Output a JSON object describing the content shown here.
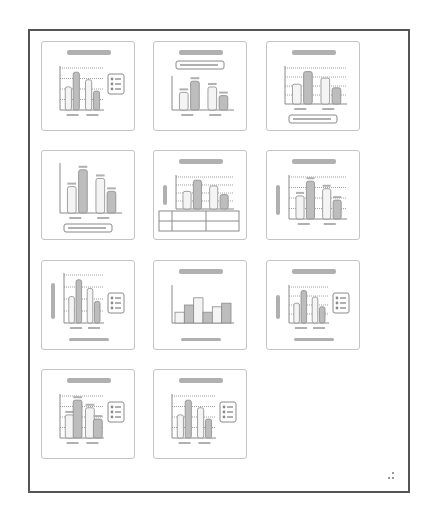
{
  "gallery": {
    "name": "Chart Quick Layout gallery",
    "columns": 3,
    "layouts": [
      {
        "id": "layout-1",
        "title": true,
        "legend": "right",
        "gridlines": true,
        "ytitle": false,
        "xtitle": false,
        "table": false
      },
      {
        "id": "layout-2",
        "title": true,
        "legend": "top",
        "gridlines": false,
        "datalabels": true
      },
      {
        "id": "layout-3",
        "title": true,
        "legend": "bottom",
        "gridlines": true
      },
      {
        "id": "layout-4",
        "title": false,
        "legend": "bottom",
        "gridlines": false,
        "datalabels": true
      },
      {
        "id": "layout-5",
        "title": true,
        "legend": "none",
        "gridlines": true,
        "ytitle": true,
        "table": true
      },
      {
        "id": "layout-6",
        "title": true,
        "legend": "none",
        "gridlines": true,
        "ytitle": true,
        "datalabels": true
      },
      {
        "id": "layout-7",
        "title": false,
        "legend": "right",
        "gridlines": true,
        "ytitle": true,
        "xtitle": true
      },
      {
        "id": "layout-8",
        "title": true,
        "legend": "none",
        "gridlines": false,
        "xtitle": true,
        "gapless": true
      },
      {
        "id": "layout-9",
        "title": true,
        "legend": "right",
        "gridlines": true,
        "ytitle": true,
        "xtitle": true
      },
      {
        "id": "layout-10",
        "title": true,
        "legend": "right",
        "gridlines": true,
        "datalabels": true,
        "wide": true
      },
      {
        "id": "layout-11",
        "title": true,
        "legend": "right",
        "gridlines": true
      }
    ]
  },
  "colors": {
    "frame_border": "#555555",
    "thumb_border": "#c4c4c4",
    "chart_line": "#8a8a8a",
    "bar_fill_light": "#f4f4f4",
    "bar_fill_dark": "#bdbdbd",
    "title_bar": "#b0b0b0"
  }
}
